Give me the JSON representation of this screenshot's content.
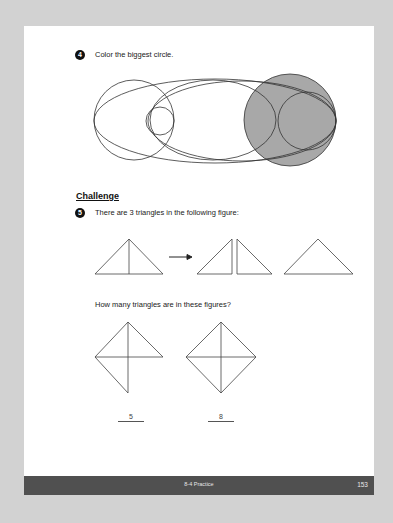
{
  "questions": [
    {
      "number": "4",
      "text": "Color the biggest circle."
    },
    {
      "number": "5",
      "text": "There are 3 triangles in the following figure:"
    }
  ],
  "section_title": "Challenge",
  "sub_question": "How many triangles are in these figures?",
  "answers": [
    "5",
    "8"
  ],
  "footer": {
    "title": "8-4 Practice",
    "page_number": "153"
  },
  "colors": {
    "shaded_circle": "#a8a8a8",
    "footer_bg": "#505050",
    "background": "#d2d2d2"
  }
}
